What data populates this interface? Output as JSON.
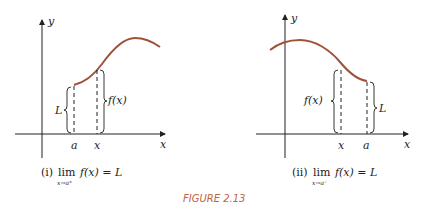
{
  "colors": {
    "curve": "#a0513a",
    "axis": "#222222",
    "figure_label": "#c0623f"
  },
  "panel_left": {
    "y_label": "y",
    "x_label": "x",
    "tick_a": "a",
    "tick_x": "x",
    "brace_left_label": "L",
    "brace_right_label": "f(x)",
    "caption_prefix": "(i)",
    "caption_lim": "lim",
    "caption_sub": "x→a⁺",
    "caption_expr": "f(x) = L"
  },
  "panel_right": {
    "y_label": "y",
    "x_label": "x",
    "tick_x": "x",
    "tick_a": "a",
    "brace_left_label": "f(x)",
    "brace_right_label": "L",
    "caption_prefix": "(ii)",
    "caption_lim": "lim",
    "caption_sub": "x→a⁻",
    "caption_expr": "f(x) = L"
  },
  "figure_label": "FIGURE 2.13"
}
